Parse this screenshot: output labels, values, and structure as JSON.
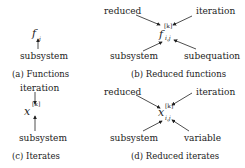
{
  "panels": [
    {
      "id": "a",
      "caption": "(a) Functions",
      "symbol": {
        "base": "f",
        "sub": "i"
      },
      "labels": {
        "bottom": "subsystem"
      }
    },
    {
      "id": "b",
      "caption": "(b) Reduced functions",
      "symbol": {
        "base": "f",
        "sup": "[k]",
        "sub": "i,j"
      },
      "labels": {
        "top_left": "reduced",
        "top_right": "iteration",
        "bottom_left": "subsystem",
        "bottom_right": "subequation"
      }
    },
    {
      "id": "c",
      "caption": "(c) Iterates",
      "symbol": {
        "base": "x",
        "sup": "[k]"
      },
      "labels": {
        "top": "iteration",
        "bottom": "subsystem"
      }
    },
    {
      "id": "d",
      "caption": "(d) Reduced iterates",
      "symbol": {
        "base": "x",
        "sup": "[k]",
        "sub": "i,j"
      },
      "labels": {
        "top_left": "reduced",
        "top_right": "iteration",
        "bottom_left": "subsystem",
        "bottom_right": "variable"
      }
    }
  ]
}
